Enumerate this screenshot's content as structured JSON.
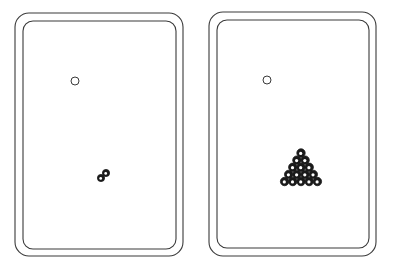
{
  "illustration": {
    "description": "Hand-drawn sketch of two billiards tables side by side",
    "stroke_color": "#3a3a3a",
    "ball_color": "#1a1a1a",
    "tables": [
      {
        "id": "left",
        "outer": {
          "x": 15,
          "y": 13,
          "w": 168,
          "h": 243,
          "r": 14
        },
        "inner": {
          "x": 23,
          "y": 21,
          "w": 153,
          "h": 228,
          "r": 10
        },
        "cue_ball": {
          "cx": 75,
          "cy": 81,
          "r": 4
        },
        "balls": [
          {
            "cx": 101,
            "cy": 178,
            "r": 3.6
          },
          {
            "cx": 106,
            "cy": 173,
            "r": 3.6
          }
        ]
      },
      {
        "id": "right",
        "outer": {
          "x": 209,
          "y": 12,
          "w": 167,
          "h": 244,
          "r": 14
        },
        "inner": {
          "x": 217,
          "y": 20,
          "w": 152,
          "h": 228,
          "r": 10
        },
        "cue_ball": {
          "cx": 267,
          "cy": 80,
          "r": 4
        },
        "rack": {
          "shape": "triangle",
          "rows": 5,
          "apex_x": 301,
          "apex_y": 153,
          "spacing": 8.2,
          "ball_r": 4.2,
          "count": 15
        }
      }
    ]
  }
}
